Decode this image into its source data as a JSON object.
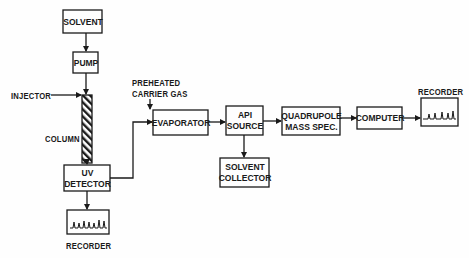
{
  "diagram": {
    "nodes": [
      {
        "id": "solvent",
        "label": "SOLVENT"
      },
      {
        "id": "pump",
        "label": "PUMP"
      },
      {
        "id": "column",
        "label": "COLUMN"
      },
      {
        "id": "uv_detector",
        "label": "UV\nDETECTOR"
      },
      {
        "id": "recorder_uv",
        "label": "RECORDER"
      },
      {
        "id": "evaporator",
        "label": "EVAPORATOR"
      },
      {
        "id": "api_source",
        "label": "API\nSOURCE"
      },
      {
        "id": "solvent_collector",
        "label": "SOLVENT\nCOLLECTOR"
      },
      {
        "id": "quadrupole",
        "label": "QUADRUPOLE\nMASS SPEC."
      },
      {
        "id": "computer",
        "label": "COMPUTER"
      },
      {
        "id": "recorder_ms",
        "label": "RECORDER"
      }
    ],
    "inputs": {
      "injector": "INJECTOR",
      "carrier_gas": "PREHEATED\nCARRIER GAS"
    },
    "edges": [
      {
        "from": "solvent",
        "to": "pump"
      },
      {
        "from": "pump",
        "to": "column"
      },
      {
        "from": "injector",
        "to": "column"
      },
      {
        "from": "column",
        "to": "uv_detector"
      },
      {
        "from": "uv_detector",
        "to": "recorder_uv"
      },
      {
        "from": "uv_detector",
        "to": "evaporator"
      },
      {
        "from": "carrier_gas",
        "to": "evaporator"
      },
      {
        "from": "evaporator",
        "to": "api_source"
      },
      {
        "from": "api_source",
        "to": "solvent_collector"
      },
      {
        "from": "api_source",
        "to": "quadrupole"
      },
      {
        "from": "quadrupole",
        "to": "computer"
      },
      {
        "from": "computer",
        "to": "recorder_ms"
      }
    ],
    "colors": {
      "line": "#1a1a1a",
      "background": "#fefefe"
    }
  }
}
